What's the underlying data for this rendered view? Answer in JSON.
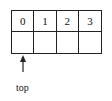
{
  "diagram": {
    "type": "array-stack",
    "cells_row1": [
      "0",
      "1",
      "2",
      "3"
    ],
    "cells_row2": [
      "",
      "",
      "",
      ""
    ],
    "pointer": {
      "label": "top",
      "points_to_index": 0,
      "direction": "up"
    },
    "colors": {
      "line": "#222222",
      "background": "#ffffff"
    }
  }
}
